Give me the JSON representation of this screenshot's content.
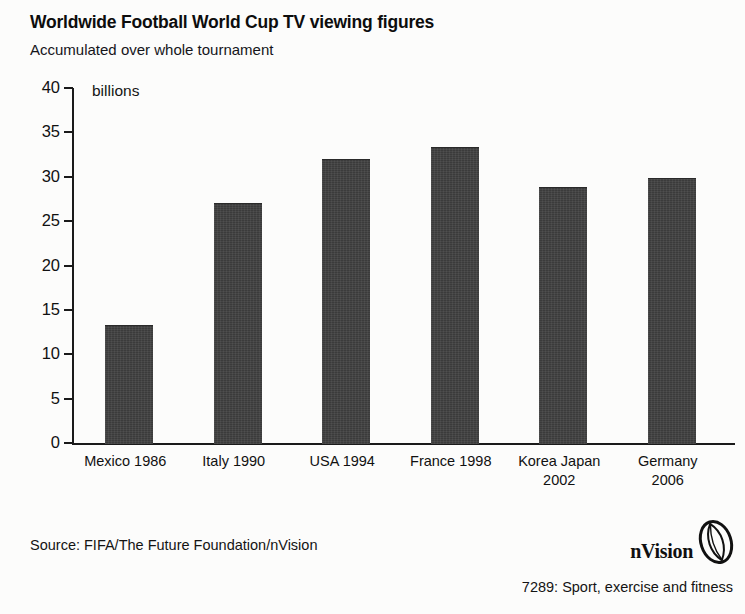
{
  "header": {
    "title": "Worldwide Football World Cup TV viewing figures",
    "subtitle": "Accumulated over whole tournament"
  },
  "footer": {
    "source": "Source: FIFA/The Future Foundation/nVision",
    "brand": "nVision",
    "catalog": "7289: Sport, exercise and fitness",
    "logo_icon": "nvision-oval-logo"
  },
  "chart_data": {
    "type": "bar",
    "title": "Worldwide Football World Cup TV viewing figures",
    "subtitle": "Accumulated over whole tournament",
    "unit_label": "billions",
    "xlabel": "",
    "ylabel": "billions",
    "ylim": [
      0,
      40
    ],
    "yticks": [
      0,
      5,
      10,
      15,
      20,
      25,
      30,
      35,
      40
    ],
    "ytick_labels": [
      "0",
      "5",
      "10",
      "15",
      "20",
      "25",
      "30",
      "35",
      "40"
    ],
    "grid": false,
    "legend": false,
    "bar_color": "#3b3b3b",
    "categories": [
      "Mexico 1986",
      "Italy 1990",
      "USA 1994",
      "France 1998",
      "Korea Japan 2002",
      "Germany 2006"
    ],
    "category_lines": [
      [
        "Mexico 1986"
      ],
      [
        "Italy 1990"
      ],
      [
        "USA 1994"
      ],
      [
        "France 1998"
      ],
      [
        "Korea Japan",
        "2002"
      ],
      [
        "Germany",
        "2006"
      ]
    ],
    "values": [
      13.3,
      27.0,
      32.0,
      33.3,
      28.8,
      29.9
    ]
  }
}
